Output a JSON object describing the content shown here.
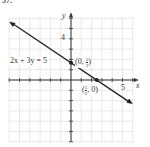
{
  "problem_number": "57.",
  "chart_data": {
    "type": "line",
    "title": "",
    "equation_label": "2x + 3y = 5",
    "xlabel": "x",
    "ylabel": "y",
    "xlim": [
      -6,
      6
    ],
    "ylim": [
      -6,
      6
    ],
    "grid": true,
    "x_tick_labels": [
      {
        "value": 5,
        "label": "5"
      }
    ],
    "y_tick_labels": [
      {
        "value": 4,
        "label": "4"
      }
    ],
    "series": [
      {
        "name": "2x + 3y = 5",
        "x": [
          -6,
          6
        ],
        "y": [
          5.667,
          -2.333
        ]
      }
    ],
    "points": [
      {
        "x": 0,
        "y": 1.667,
        "label": "(0, 5/3)",
        "label_parts": {
          "open": "(0, ",
          "num": "5",
          "den": "3",
          "close": ")"
        }
      },
      {
        "x": 2.5,
        "y": 0,
        "label": "(5/2, 0)",
        "label_parts": {
          "open": "(",
          "num": "5",
          "den": "2",
          "close": ", 0)"
        }
      }
    ]
  },
  "colors": {
    "grid": "#d6d6d6",
    "axis": "#333333",
    "line": "#222222",
    "text": "#333333"
  }
}
